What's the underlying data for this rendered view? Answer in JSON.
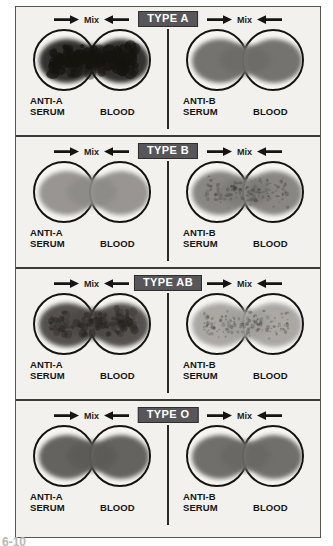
{
  "figure": {
    "figure_number": "6-10",
    "colors": {
      "badge_bg": "#57565a",
      "badge_text": "#ffffff",
      "plate_bg": "#f2f1ee",
      "ink": "#151413",
      "divider": "#3b3a36"
    }
  },
  "bands": [
    {
      "badge": "TYPE A",
      "tests": [
        {
          "mix_label": "Mix",
          "serum_label": "ANTI-A",
          "serum_sub": "SERUM",
          "blood_label": "BLOOD",
          "reaction": "agglutination",
          "drop_color": "#2a2725",
          "drop_opacity": 0.95,
          "clump_level": "heavy"
        },
        {
          "mix_label": "Mix",
          "serum_label": "ANTI-B",
          "serum_sub": "SERUM",
          "blood_label": "BLOOD",
          "reaction": "no-agglutination",
          "drop_color": "#6e6c69",
          "drop_opacity": 0.95,
          "clump_level": "none"
        }
      ]
    },
    {
      "badge": "TYPE B",
      "tests": [
        {
          "mix_label": "Mix",
          "serum_label": "ANTI-A",
          "serum_sub": "SERUM",
          "blood_label": "BLOOD",
          "reaction": "no-agglutination",
          "drop_color": "#8d8b88",
          "drop_opacity": 0.9,
          "clump_level": "none"
        },
        {
          "mix_label": "Mix",
          "serum_label": "ANTI-B",
          "serum_sub": "SERUM",
          "blood_label": "BLOOD",
          "reaction": "agglutination",
          "drop_color": "#7d7b77",
          "drop_opacity": 0.9,
          "clump_level": "fine"
        }
      ]
    },
    {
      "badge": "TYPE AB",
      "tests": [
        {
          "mix_label": "Mix",
          "serum_label": "ANTI-A",
          "serum_sub": "SERUM",
          "blood_label": "BLOOD",
          "reaction": "agglutination",
          "drop_color": "#4b4845",
          "drop_opacity": 0.95,
          "clump_level": "medium"
        },
        {
          "mix_label": "Mix",
          "serum_label": "ANTI-B",
          "serum_sub": "SERUM",
          "blood_label": "BLOOD",
          "reaction": "agglutination",
          "drop_color": "#a2a09c",
          "drop_opacity": 0.9,
          "clump_level": "fine"
        }
      ]
    },
    {
      "badge": "TYPE O",
      "tests": [
        {
          "mix_label": "Mix",
          "serum_label": "ANTI-A",
          "serum_sub": "SERUM",
          "blood_label": "BLOOD",
          "reaction": "no-agglutination",
          "drop_color": "#5d5b58",
          "drop_opacity": 0.95,
          "clump_level": "none"
        },
        {
          "mix_label": "Mix",
          "serum_label": "ANTI-B",
          "serum_sub": "SERUM",
          "blood_label": "BLOOD",
          "reaction": "no-agglutination",
          "drop_color": "#6a6865",
          "drop_opacity": 0.95,
          "clump_level": "none"
        }
      ]
    }
  ]
}
